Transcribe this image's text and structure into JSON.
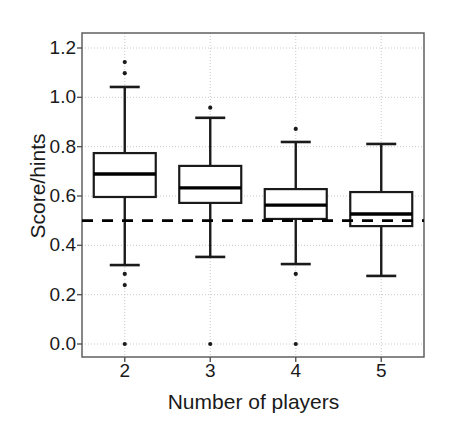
{
  "chart_data": {
    "type": "box",
    "title": "",
    "xlabel": "Number of players",
    "ylabel": "Score/hints",
    "categories": [
      "2",
      "3",
      "4",
      "5"
    ],
    "xtick_labels": [
      "2",
      "3",
      "4",
      "5"
    ],
    "ytick_labels": [
      "0.0",
      "0.2",
      "0.4",
      "0.6",
      "0.8",
      "1.0",
      "1.2"
    ],
    "ytick_values": [
      0.0,
      0.2,
      0.4,
      0.6,
      0.8,
      1.0,
      1.2
    ],
    "ylim": [
      -0.06,
      1.26
    ],
    "xlim": [
      1.5,
      5.5
    ],
    "grid": true,
    "grid_axis": "both",
    "legend": "none",
    "reference_line": {
      "value": 0.5,
      "style": "dashed",
      "orientation": "horizontal",
      "color": "#000000"
    },
    "colors": {
      "box_fill": "#ffffff",
      "box_stroke": "#1a1a1a",
      "median": "#000000",
      "whisker": "#1a1a1a",
      "outlier": "#1a1a1a",
      "grid": "#c8c8c8",
      "frame": "#555555",
      "background": "#ffffff"
    },
    "boxes": [
      {
        "category": "2",
        "x": 2,
        "whisker_low": 0.32,
        "q1": 0.596,
        "median": 0.689,
        "q3": 0.774,
        "whisker_high": 1.042,
        "outliers": [
          1.143,
          1.098,
          0.284,
          0.239,
          0.0
        ]
      },
      {
        "category": "3",
        "x": 3,
        "whisker_low": 0.353,
        "q1": 0.572,
        "median": 0.633,
        "q3": 0.722,
        "whisker_high": 0.917,
        "outliers": [
          0.958,
          0.0
        ]
      },
      {
        "category": "4",
        "x": 4,
        "whisker_low": 0.324,
        "q1": 0.507,
        "median": 0.563,
        "q3": 0.628,
        "whisker_high": 0.819,
        "outliers": [
          0.872,
          0.284,
          0.0
        ]
      },
      {
        "category": "5",
        "x": 5,
        "whisker_low": 0.276,
        "q1": 0.478,
        "median": 0.527,
        "q3": 0.616,
        "whisker_high": 0.811,
        "outliers": []
      }
    ]
  }
}
